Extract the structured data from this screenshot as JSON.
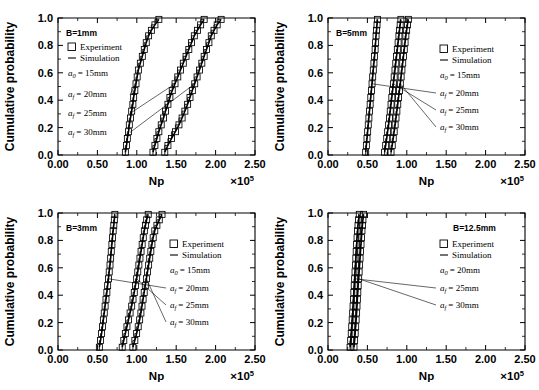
{
  "figure": {
    "name": "cumulative-probability-four-panel-figure",
    "axis": {
      "xlabel": "Np",
      "ylabel": "Cumulative probability",
      "x_exponent_base": "×10",
      "x_exponent_power": "5",
      "xticks": [
        "0.00",
        "0.50",
        "1.00",
        "1.50",
        "2.00",
        "2.50"
      ],
      "xtick_values": [
        0,
        0.5,
        1.0,
        1.5,
        2.0,
        2.5
      ],
      "yticks": [
        "0.0",
        "0.2",
        "0.4",
        "0.6",
        "0.8",
        "1.0"
      ],
      "ytick_values": [
        0,
        0.2,
        0.4,
        0.6,
        0.8,
        1.0
      ],
      "xlim": [
        0,
        2.5
      ],
      "ylim": [
        0,
        1.0
      ],
      "minor_ticks_per_interval": 1,
      "grid": false
    },
    "legend": {
      "experiment_label": "Experiment",
      "simulation_label": "Simulation",
      "experiment_marker": "open-square",
      "simulation_marker": "solid-line"
    }
  },
  "chart_data": [
    {
      "type": "line",
      "panel_id": "panel-b1mm",
      "title": "B=1mm",
      "xlabel": "Np",
      "ylabel": "Cumulative probability",
      "xlim": [
        0,
        2.5
      ],
      "ylim": [
        0,
        1.0
      ],
      "initial_crack": "a0 = 15mm",
      "initial_crack_symbol": "a",
      "initial_crack_sub": "0",
      "initial_crack_value": "= 15mm",
      "legend_position": "upper-left",
      "annotation_position": "left",
      "annotations": [
        {
          "symbol": "a",
          "sub": "f",
          "value": "= 20mm"
        },
        {
          "symbol": "a",
          "sub": "f",
          "value": "= 25mm"
        },
        {
          "symbol": "a",
          "sub": "f",
          "value": "= 30mm"
        }
      ],
      "series": [
        {
          "name": "af = 20mm",
          "x": [
            0.855,
            0.87,
            0.88,
            0.895,
            0.905,
            0.92,
            0.935,
            0.95,
            0.96,
            0.975,
            0.99,
            1.005,
            1.02,
            1.045,
            1.07,
            1.095,
            1.12,
            1.15,
            1.185,
            1.23,
            1.28
          ],
          "y": [
            0.02,
            0.07,
            0.12,
            0.17,
            0.22,
            0.27,
            0.32,
            0.37,
            0.42,
            0.47,
            0.52,
            0.57,
            0.62,
            0.67,
            0.72,
            0.77,
            0.82,
            0.87,
            0.91,
            0.95,
            0.99
          ]
        },
        {
          "name": "af = 25mm",
          "x": [
            1.205,
            1.23,
            1.255,
            1.28,
            1.31,
            1.34,
            1.365,
            1.395,
            1.42,
            1.45,
            1.485,
            1.52,
            1.555,
            1.59,
            1.625,
            1.66,
            1.695,
            1.73,
            1.77,
            1.81,
            1.855
          ],
          "y": [
            0.02,
            0.07,
            0.12,
            0.17,
            0.22,
            0.27,
            0.32,
            0.37,
            0.42,
            0.47,
            0.52,
            0.57,
            0.62,
            0.67,
            0.72,
            0.77,
            0.82,
            0.87,
            0.91,
            0.95,
            0.99
          ]
        },
        {
          "name": "af = 30mm",
          "x": [
            1.355,
            1.395,
            1.44,
            1.49,
            1.535,
            1.575,
            1.61,
            1.645,
            1.675,
            1.705,
            1.735,
            1.765,
            1.795,
            1.825,
            1.855,
            1.885,
            1.915,
            1.945,
            1.98,
            2.02,
            2.07
          ],
          "y": [
            0.02,
            0.07,
            0.12,
            0.17,
            0.22,
            0.27,
            0.32,
            0.37,
            0.42,
            0.47,
            0.52,
            0.57,
            0.62,
            0.67,
            0.72,
            0.77,
            0.82,
            0.87,
            0.91,
            0.95,
            0.99
          ]
        }
      ]
    },
    {
      "type": "line",
      "panel_id": "panel-b5mm",
      "title": "B=5mm",
      "xlabel": "Np",
      "ylabel": "Cumulative probability",
      "xlim": [
        0,
        2.5
      ],
      "ylim": [
        0,
        1.0
      ],
      "initial_crack": "a0 = 15mm",
      "initial_crack_symbol": "a",
      "initial_crack_sub": "0",
      "initial_crack_value": "= 15mm",
      "legend_position": "upper-right",
      "annotation_position": "right",
      "annotations": [
        {
          "symbol": "a",
          "sub": "f",
          "value": "= 20mm"
        },
        {
          "symbol": "a",
          "sub": "f",
          "value": "= 25mm"
        },
        {
          "symbol": "a",
          "sub": "f",
          "value": "= 30mm"
        }
      ],
      "series": [
        {
          "name": "af = 20mm",
          "x": [
            0.478,
            0.487,
            0.495,
            0.503,
            0.511,
            0.519,
            0.527,
            0.535,
            0.543,
            0.551,
            0.559,
            0.567,
            0.575,
            0.583,
            0.591,
            0.598,
            0.604,
            0.61,
            0.616,
            0.622,
            0.628
          ],
          "y": [
            0.02,
            0.07,
            0.12,
            0.17,
            0.22,
            0.27,
            0.32,
            0.37,
            0.42,
            0.47,
            0.52,
            0.57,
            0.62,
            0.67,
            0.72,
            0.77,
            0.82,
            0.87,
            0.91,
            0.95,
            0.99
          ]
        },
        {
          "name": "af = 25mm",
          "x": [
            0.718,
            0.732,
            0.745,
            0.757,
            0.769,
            0.78,
            0.79,
            0.8,
            0.81,
            0.82,
            0.83,
            0.84,
            0.85,
            0.86,
            0.87,
            0.88,
            0.89,
            0.9,
            0.908,
            0.916,
            0.925
          ],
          "y": [
            0.02,
            0.07,
            0.12,
            0.17,
            0.22,
            0.27,
            0.32,
            0.37,
            0.42,
            0.47,
            0.52,
            0.57,
            0.62,
            0.67,
            0.72,
            0.77,
            0.82,
            0.87,
            0.91,
            0.95,
            0.99
          ]
        },
        {
          "name": "af = 30mm",
          "x": [
            0.8,
            0.815,
            0.828,
            0.84,
            0.852,
            0.863,
            0.874,
            0.885,
            0.896,
            0.907,
            0.918,
            0.928,
            0.938,
            0.948,
            0.958,
            0.968,
            0.978,
            0.988,
            0.998,
            1.008,
            1.02
          ],
          "y": [
            0.02,
            0.07,
            0.12,
            0.17,
            0.22,
            0.27,
            0.32,
            0.37,
            0.42,
            0.47,
            0.52,
            0.57,
            0.62,
            0.67,
            0.72,
            0.77,
            0.82,
            0.87,
            0.91,
            0.95,
            0.99
          ]
        }
      ]
    },
    {
      "type": "line",
      "panel_id": "panel-b3mm",
      "title": "B=3mm",
      "xlabel": "Np",
      "ylabel": "Cumulative probability",
      "xlim": [
        0,
        2.5
      ],
      "ylim": [
        0,
        1.0
      ],
      "initial_crack": "a0 = 15mm",
      "initial_crack_symbol": "a",
      "initial_crack_sub": "0",
      "initial_crack_value": "= 15mm",
      "legend_position": "upper-right",
      "annotation_position": "right",
      "annotations": [
        {
          "symbol": "a",
          "sub": "f",
          "value": "= 20mm"
        },
        {
          "symbol": "a",
          "sub": "f",
          "value": "= 25mm"
        },
        {
          "symbol": "a",
          "sub": "f",
          "value": "= 30mm"
        }
      ],
      "series": [
        {
          "name": "af = 20mm",
          "x": [
            0.525,
            0.54,
            0.553,
            0.565,
            0.576,
            0.587,
            0.598,
            0.609,
            0.62,
            0.63,
            0.64,
            0.65,
            0.66,
            0.668,
            0.676,
            0.684,
            0.692,
            0.7,
            0.708,
            0.715,
            0.722
          ],
          "y": [
            0.02,
            0.07,
            0.12,
            0.17,
            0.22,
            0.27,
            0.32,
            0.37,
            0.42,
            0.47,
            0.52,
            0.57,
            0.62,
            0.67,
            0.72,
            0.77,
            0.82,
            0.87,
            0.91,
            0.95,
            0.99
          ]
        },
        {
          "name": "af = 25mm",
          "x": [
            0.815,
            0.835,
            0.855,
            0.875,
            0.895,
            0.915,
            0.935,
            0.952,
            0.968,
            0.983,
            0.998,
            1.012,
            1.026,
            1.04,
            1.054,
            1.068,
            1.082,
            1.096,
            1.11,
            1.125,
            1.145
          ],
          "y": [
            0.02,
            0.07,
            0.12,
            0.17,
            0.22,
            0.27,
            0.32,
            0.37,
            0.42,
            0.47,
            0.52,
            0.57,
            0.62,
            0.67,
            0.72,
            0.77,
            0.82,
            0.87,
            0.91,
            0.95,
            0.99
          ]
        },
        {
          "name": "af = 30mm",
          "x": [
            0.95,
            0.975,
            0.998,
            1.018,
            1.036,
            1.052,
            1.066,
            1.08,
            1.094,
            1.108,
            1.122,
            1.136,
            1.15,
            1.164,
            1.178,
            1.192,
            1.208,
            1.228,
            1.255,
            1.285,
            1.32
          ],
          "y": [
            0.02,
            0.07,
            0.12,
            0.17,
            0.22,
            0.27,
            0.32,
            0.37,
            0.42,
            0.47,
            0.52,
            0.57,
            0.62,
            0.67,
            0.72,
            0.77,
            0.82,
            0.87,
            0.91,
            0.95,
            0.99
          ]
        }
      ]
    },
    {
      "type": "line",
      "panel_id": "panel-b12_5mm",
      "title": "B=12.5mm",
      "xlabel": "Np",
      "ylabel": "Cumulative probability",
      "xlim": [
        0,
        2.5
      ],
      "ylim": [
        0,
        1.0
      ],
      "initial_crack": "a0 = 20mm",
      "initial_crack_symbol": "a",
      "initial_crack_sub": "0",
      "initial_crack_value": "= 20mm",
      "legend_position": "upper-right",
      "annotation_position": "right",
      "annotations": [
        {
          "symbol": "a",
          "sub": "f",
          "value": "= 25mm"
        },
        {
          "symbol": "a",
          "sub": "f",
          "value": "= 30mm"
        }
      ],
      "series": [
        {
          "name": "af = 25mm",
          "x": [
            0.28,
            0.288,
            0.295,
            0.301,
            0.307,
            0.313,
            0.318,
            0.323,
            0.328,
            0.333,
            0.338,
            0.343,
            0.348,
            0.353,
            0.358,
            0.363,
            0.369,
            0.375,
            0.381,
            0.388,
            0.397
          ],
          "y": [
            0.02,
            0.07,
            0.12,
            0.17,
            0.22,
            0.27,
            0.32,
            0.37,
            0.42,
            0.47,
            0.52,
            0.57,
            0.62,
            0.67,
            0.72,
            0.77,
            0.82,
            0.87,
            0.91,
            0.95,
            0.99
          ]
        },
        {
          "name": "af = 30mm",
          "x": [
            0.33,
            0.338,
            0.345,
            0.351,
            0.357,
            0.363,
            0.368,
            0.373,
            0.378,
            0.383,
            0.389,
            0.395,
            0.401,
            0.407,
            0.413,
            0.419,
            0.425,
            0.431,
            0.437,
            0.443,
            0.452
          ],
          "y": [
            0.02,
            0.07,
            0.12,
            0.17,
            0.22,
            0.27,
            0.32,
            0.37,
            0.42,
            0.47,
            0.52,
            0.57,
            0.62,
            0.67,
            0.72,
            0.77,
            0.82,
            0.87,
            0.91,
            0.95,
            0.99
          ]
        }
      ]
    }
  ]
}
